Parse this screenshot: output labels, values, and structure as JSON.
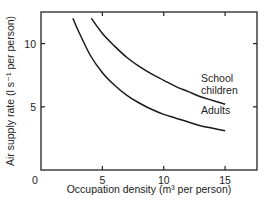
{
  "chart_data": {
    "type": "line",
    "title": "",
    "xlabel": "Occupation density (m³ per person)",
    "ylabel": "Air supply rate (l s⁻¹ per person)",
    "xlim": [
      0,
      17.6
    ],
    "ylim": [
      0,
      12.5
    ],
    "x_ticks": [
      0,
      5,
      10,
      15
    ],
    "y_ticks": [
      5,
      10
    ],
    "x_tick_labels": [
      "0",
      "5",
      "10",
      "15"
    ],
    "y_tick_labels": [
      "5",
      "10"
    ],
    "grid": false,
    "legend": "inline labels near curve ends",
    "series": [
      {
        "name": "School children",
        "label_lines": [
          "School",
          "children"
        ],
        "x": [
          4.1,
          5,
          6,
          7,
          8,
          9,
          10,
          11,
          12,
          13,
          14,
          15
        ],
        "y": [
          12.0,
          10.8,
          9.8,
          8.9,
          8.2,
          7.6,
          7.1,
          6.6,
          6.2,
          5.8,
          5.5,
          5.2
        ]
      },
      {
        "name": "Adults",
        "label_lines": [
          "Adults"
        ],
        "x": [
          2.6,
          3,
          4,
          5,
          6,
          7,
          8,
          9,
          10,
          11,
          12,
          13,
          14,
          15
        ],
        "y": [
          12.0,
          11.1,
          9.1,
          7.7,
          6.7,
          5.9,
          5.3,
          4.8,
          4.4,
          4.1,
          3.8,
          3.5,
          3.3,
          3.1
        ]
      }
    ]
  }
}
